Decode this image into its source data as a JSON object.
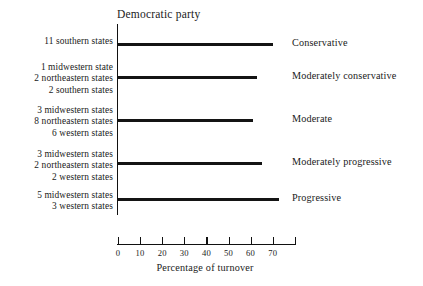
{
  "chart_data": {
    "type": "bar",
    "orientation": "horizontal",
    "title": "Democratic party",
    "xlabel": "Percentage of turnover",
    "ylabel": "",
    "xlim": [
      0,
      80
    ],
    "xticks": [
      0,
      10,
      20,
      30,
      40,
      50,
      60,
      70,
      80
    ],
    "xtick_labels": [
      "0",
      "10",
      "20",
      "30",
      "40",
      "50",
      "60",
      "70",
      ""
    ],
    "grid": false,
    "legend": false,
    "categories": [
      "Conservative",
      "Moderately conservative",
      "Moderate",
      "Moderately progressive",
      "Progressive"
    ],
    "values": [
      70,
      63,
      61,
      65,
      73
    ],
    "group_labels": [
      [
        "11 southern states"
      ],
      [
        "1 midwestern state",
        "2 northeastern states",
        "2 southern states"
      ],
      [
        "3 midwestern states",
        "8 northeastern states",
        "6 western states"
      ],
      [
        "3 midwestern states",
        "2 northeastern states",
        "2 western states"
      ],
      [
        "5 midwestern states",
        "3 western states"
      ]
    ]
  },
  "colors": {
    "bar": "#141414",
    "axis": "#111111",
    "text": "#1a1a1a",
    "background": "#ffffff"
  }
}
